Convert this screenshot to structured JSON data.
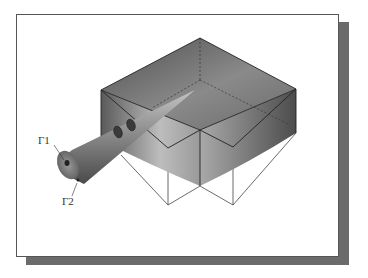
{
  "figure": {
    "labels": {
      "gamma1": "Γ1",
      "gamma2": "Γ2"
    },
    "colors": {
      "frame_border": "#555555",
      "shadow": "#6b6b6b",
      "box_dark": "#4a4a4a",
      "box_light": "#c8c8c8",
      "edge": "#222222",
      "wire": "#444444"
    },
    "elements": {
      "box": "3D rectangular block with gradient shading",
      "cone": "conical nozzle probe entering block",
      "wireframe": "projection lines below block"
    }
  }
}
